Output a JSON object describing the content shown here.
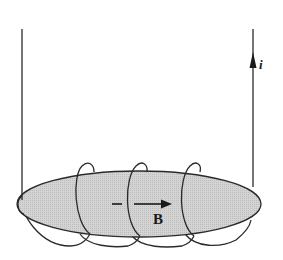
{
  "diagram": {
    "type": "physics-solenoid-toroid-section",
    "labels": {
      "current": "i",
      "field": "B"
    },
    "colors": {
      "line": "#2a2a2a",
      "core_fill": "#cfcfcf",
      "background": "#ffffff"
    },
    "elements": {
      "left_lead": "vertical wire lead on left",
      "right_lead": "vertical wire lead on right with upward current arrow",
      "core": "flat elliptical core (gray)",
      "coil_turns": 4,
      "field_arrow": "arrow pointing right inside core"
    }
  }
}
